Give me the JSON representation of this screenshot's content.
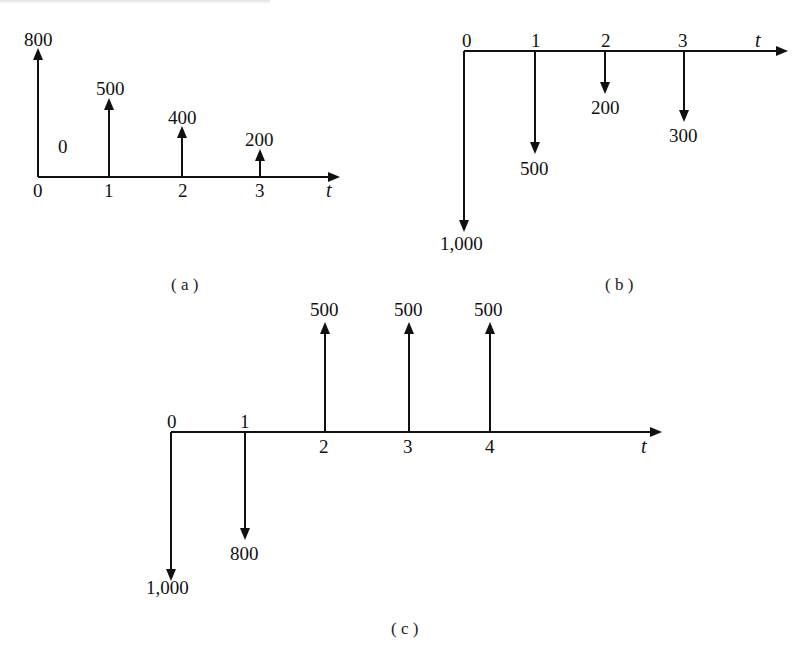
{
  "figure": {
    "panels": [
      {
        "id": "a",
        "caption": "( a )",
        "axis_label": "t",
        "ticks": [
          "0",
          "1",
          "2",
          "3"
        ],
        "flows": [
          {
            "t": "0",
            "value": "800",
            "direction": "up"
          },
          {
            "t": "0-1",
            "value": "0",
            "direction": "none"
          },
          {
            "t": "1",
            "value": "500",
            "direction": "up"
          },
          {
            "t": "2",
            "value": "400",
            "direction": "up"
          },
          {
            "t": "3",
            "value": "200",
            "direction": "up"
          }
        ]
      },
      {
        "id": "b",
        "caption": "( b )",
        "axis_label": "t",
        "ticks": [
          "0",
          "1",
          "2",
          "3"
        ],
        "flows": [
          {
            "t": "0",
            "value": "1,000",
            "direction": "down"
          },
          {
            "t": "1",
            "value": "500",
            "direction": "down"
          },
          {
            "t": "2",
            "value": "200",
            "direction": "down"
          },
          {
            "t": "3",
            "value": "300",
            "direction": "down"
          }
        ]
      },
      {
        "id": "c",
        "caption": "( c )",
        "axis_label": "t",
        "ticks": [
          "0",
          "1",
          "2",
          "3",
          "4"
        ],
        "flows": [
          {
            "t": "0",
            "value": "1,000",
            "direction": "down"
          },
          {
            "t": "1",
            "value": "800",
            "direction": "down"
          },
          {
            "t": "2",
            "value": "500",
            "direction": "up"
          },
          {
            "t": "3",
            "value": "500",
            "direction": "up"
          },
          {
            "t": "4",
            "value": "500",
            "direction": "up"
          }
        ]
      }
    ]
  }
}
